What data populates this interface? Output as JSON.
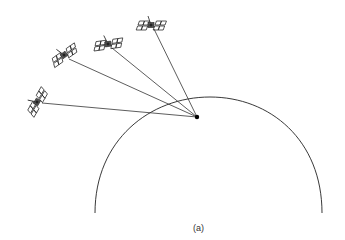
{
  "diagram": {
    "caption": "(a)",
    "caption_pos": [
      193,
      223
    ],
    "earth_arc": {
      "start": [
        95,
        213
      ],
      "peak": [
        210,
        97
      ],
      "end": [
        322,
        213
      ],
      "stroke": "#222222"
    },
    "receiver": {
      "label": "receiver",
      "pos": [
        197,
        117
      ],
      "color": "#000000"
    },
    "satellites": [
      {
        "name": "satellite-1",
        "pos": [
          151,
          25
        ],
        "angle": 0
      },
      {
        "name": "satellite-2",
        "pos": [
          108,
          44
        ],
        "angle": -8
      },
      {
        "name": "satellite-3",
        "pos": [
          64,
          55
        ],
        "angle": -35
      },
      {
        "name": "satellite-4",
        "pos": [
          37,
          102
        ],
        "angle": -60
      }
    ],
    "line_color": "#333333"
  }
}
